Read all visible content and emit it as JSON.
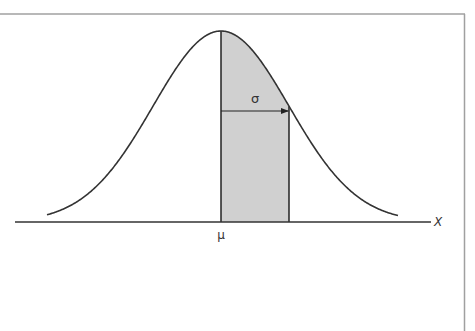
{
  "diagram": {
    "type": "normal-distribution",
    "labels": {
      "mean": "μ",
      "sigma": "σ",
      "x_axis": "X"
    },
    "geometry": {
      "mean_x": 221,
      "sigma_px": 68,
      "baseline_y": 222,
      "peak_y": 31,
      "curve_start_x": 47,
      "curve_end_x": 398,
      "axis_start_x": 15,
      "axis_end_x": 431,
      "sigma_arrow_y": 111
    },
    "colors": {
      "curve": "#333333",
      "shade": "#d0d0d0",
      "axis": "#333333",
      "frame": "#a0a0a0",
      "background": "#ffffff"
    }
  }
}
